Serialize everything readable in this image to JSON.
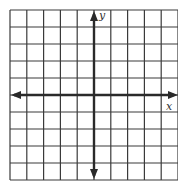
{
  "diagram": {
    "type": "coordinate-plane",
    "grid": {
      "columns": 10,
      "rows": 10,
      "left": 10,
      "top": 10,
      "cell_width": 16.8,
      "cell_height": 17,
      "line_color": "#3a3a3a"
    },
    "axes": {
      "color": "#2a2a2a",
      "x_axis_row_index": 5,
      "y_axis_column_index": 5,
      "x_label": "x",
      "y_label": "y",
      "arrows": [
        "left",
        "right",
        "up",
        "down"
      ]
    }
  }
}
